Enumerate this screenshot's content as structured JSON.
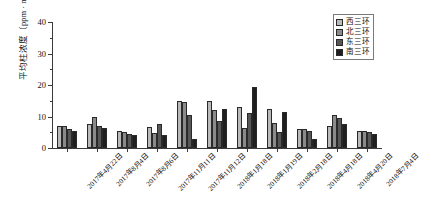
{
  "chart_data": {
    "type": "bar",
    "title": "",
    "xlabel": "",
    "ylabel": "平均柱浓度（ppm · m）",
    "ylim": [
      0,
      40
    ],
    "ytick_labels": [
      "0",
      "10",
      "20",
      "30",
      "40"
    ],
    "ytick_values": [
      0,
      10,
      20,
      30,
      40
    ],
    "yminor_values": [
      5,
      15,
      25,
      35
    ],
    "grid": false,
    "legend_position": "top-right",
    "categories": [
      "2017年4月22日",
      "2017年8月4日",
      "2017年8月6日",
      "2017年11月11日",
      "2017年11月12日",
      "2018年1月18日",
      "2018年1月19日",
      "2018年2月18日",
      "2018年4月18日",
      "2018年4月20日",
      "2018年7月4日"
    ],
    "series": [
      {
        "name": "西三环",
        "color": "#b9b9b9",
        "values": [
          7.0,
          7.5,
          5.5,
          6.8,
          15.0,
          15.0,
          13.0,
          12.5,
          6.0,
          7.0,
          5.5
        ]
      },
      {
        "name": "北三环",
        "color": "#8a8a8a",
        "values": [
          7.0,
          9.8,
          5.0,
          4.8,
          14.5,
          12.0,
          6.5,
          8.0,
          6.0,
          10.5,
          5.5
        ]
      },
      {
        "name": "东三环",
        "color": "#575757",
        "values": [
          6.0,
          7.0,
          4.5,
          7.5,
          10.5,
          8.5,
          11.0,
          5.0,
          5.5,
          9.5,
          5.0
        ]
      },
      {
        "name": "南三环",
        "color": "#1f1f1f",
        "values": [
          5.5,
          6.5,
          4.0,
          4.0,
          3.0,
          12.5,
          19.5,
          11.5,
          3.0,
          7.5,
          4.5
        ]
      }
    ]
  },
  "legend": {
    "items": [
      {
        "label": "西三环",
        "color": "#b9b9b9"
      },
      {
        "label": "北三环",
        "color": "#8a8a8a"
      },
      {
        "label": "东三环",
        "color": "#575757"
      },
      {
        "label": "南三环",
        "color": "#1f1f1f"
      }
    ]
  }
}
